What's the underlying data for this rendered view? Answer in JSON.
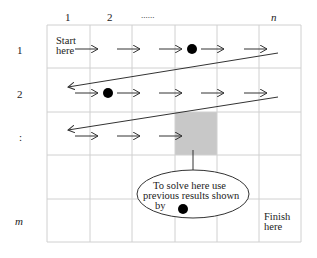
{
  "diagram": {
    "column_labels": [
      "1",
      "2",
      "......",
      "n"
    ],
    "row_labels": [
      "1",
      "2",
      ":",
      "m"
    ],
    "start_label": "Start\nhere",
    "finish_label": "Finish\nhere",
    "callout": {
      "line1": "To solve here use",
      "line2": "previous results shown",
      "line3": "by"
    },
    "grid": {
      "rows": 5,
      "columns": 6
    },
    "highlighted_cell": {
      "row": 3,
      "column": 4,
      "color": "#c8c8c8"
    },
    "dot_color": "#000000",
    "grid_line_color": "#d0d0d0"
  }
}
